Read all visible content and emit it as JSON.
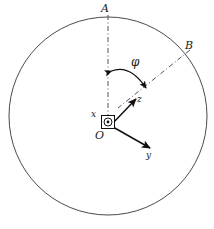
{
  "figure": {
    "width": 214,
    "height": 229,
    "background": "#ffffff",
    "stroke_color": "#3a3a3a",
    "axis_color": "#111111",
    "dashdot_color": "#555555",
    "circle": {
      "cx": 108,
      "cy": 116,
      "r": 99,
      "stroke_width": 1
    },
    "labels": {
      "A": "A",
      "B": "B",
      "phi": "φ",
      "x": "x",
      "y": "y",
      "z": "z",
      "O": "O"
    },
    "elements": {
      "line_OA": "dash-dot reference line from centre O to point A at top of circle",
      "line_OB": "dash-dot line from centre O to point B on upper-right of circle",
      "angle_arc": "double-headed curved arrow measuring angle phi between OA and OB",
      "axis_x": "x-axis out of page, drawn as circled dot inside a square at origin",
      "axis_z": "z-axis arrow pointing up and to the right",
      "axis_y": "y-axis arrow pointing down and to the right",
      "origin": "origin marker O"
    }
  }
}
